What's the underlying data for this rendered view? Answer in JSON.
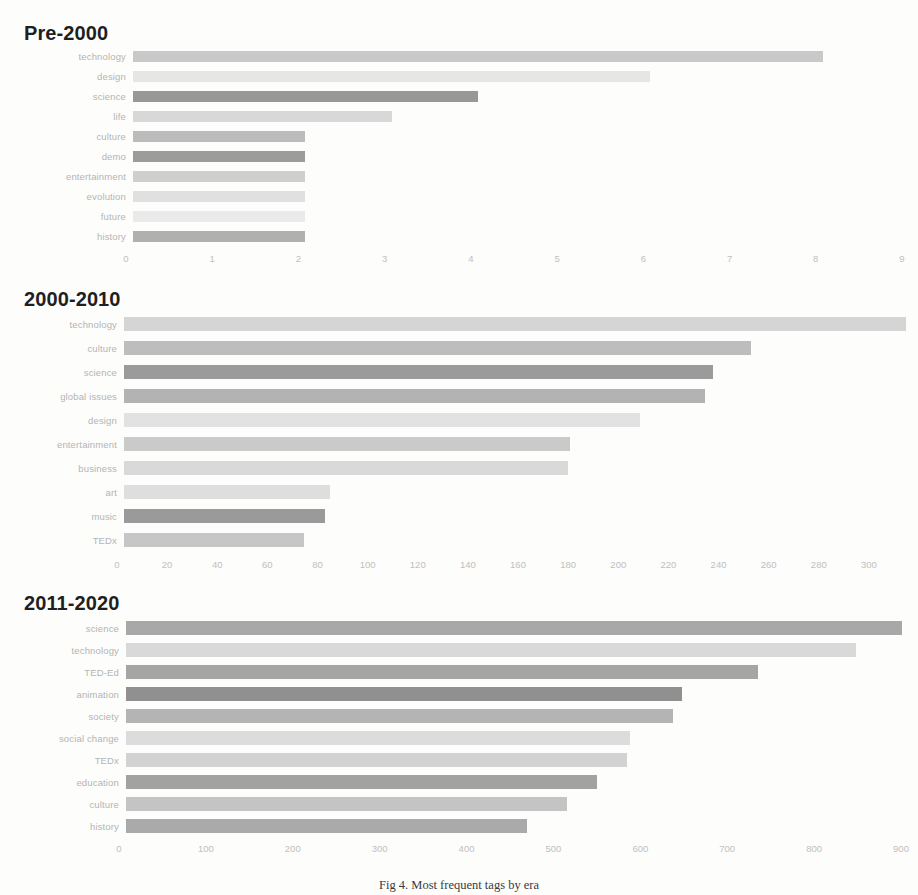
{
  "figure": {
    "caption": "Fig 4. Most frequent tags by era",
    "background": "#fdfdfc",
    "label_color": "#b4b4b4",
    "tick_color": "#c0c0c0",
    "title_color": "#1f1f1f"
  },
  "chart_data": [
    {
      "type": "bar",
      "orientation": "horizontal",
      "title": "Pre-2000",
      "xlabel": "",
      "ylabel": "",
      "grid": false,
      "legend": "none",
      "xlim": [
        0,
        9
      ],
      "xticks": [
        0,
        1,
        2,
        3,
        4,
        5,
        6,
        7,
        8,
        9
      ],
      "categories": [
        "technology",
        "design",
        "science",
        "life",
        "culture",
        "demo",
        "entertainment",
        "evolution",
        "future",
        "history"
      ],
      "values": [
        8,
        6,
        4,
        3,
        2,
        2,
        2,
        2,
        2,
        2
      ],
      "bar_colors": [
        "#c9c9c9",
        "#e6e6e6",
        "#989898",
        "#d8d8d8",
        "#bcbcbc",
        "#9c9c9c",
        "#cfcfcf",
        "#e0e0e0",
        "#eaeaea",
        "#b0b0b0"
      ]
    },
    {
      "type": "bar",
      "orientation": "horizontal",
      "title": "2000-2010",
      "xlabel": "",
      "ylabel": "",
      "grid": false,
      "legend": "none",
      "xlim": [
        0,
        312
      ],
      "xticks": [
        0,
        20,
        40,
        60,
        80,
        100,
        120,
        140,
        160,
        180,
        200,
        220,
        240,
        260,
        280,
        300
      ],
      "categories": [
        "technology",
        "culture",
        "science",
        "global issues",
        "design",
        "entertainment",
        "business",
        "art",
        "music",
        "TEDx"
      ],
      "values": [
        312,
        250,
        235,
        232,
        206,
        178,
        177,
        82,
        80,
        72
      ],
      "bar_colors": [
        "#d5d5d5",
        "#bdbdbd",
        "#9b9b9b",
        "#b3b3b3",
        "#e2e2e2",
        "#cacaca",
        "#d9d9d9",
        "#dedede",
        "#9a9a9a",
        "#c6c6c6"
      ]
    },
    {
      "type": "bar",
      "orientation": "horizontal",
      "title": "2011-2020",
      "xlabel": "",
      "ylabel": "",
      "grid": false,
      "legend": "none",
      "xlim": [
        0,
        900
      ],
      "xticks": [
        0,
        100,
        200,
        300,
        400,
        500,
        600,
        700,
        800,
        900
      ],
      "categories": [
        "science",
        "technology",
        "TED-Ed",
        "animation",
        "society",
        "social change",
        "TEDx",
        "education",
        "culture",
        "history"
      ],
      "values": [
        893,
        840,
        727,
        640,
        630,
        580,
        577,
        542,
        507,
        462
      ],
      "bar_colors": [
        "#a8a8a8",
        "#d9d9d9",
        "#a5a5a5",
        "#909090",
        "#b4b4b4",
        "#dcdcdc",
        "#d2d2d2",
        "#a2a2a2",
        "#c4c4c4",
        "#aaaaaa"
      ]
    }
  ]
}
